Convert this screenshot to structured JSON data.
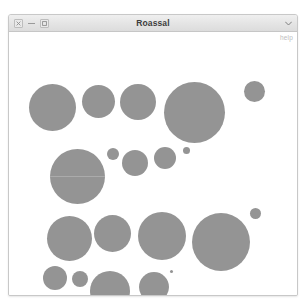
{
  "window": {
    "title": "Roassal",
    "controls": [
      {
        "name": "close",
        "glyph": "×"
      },
      {
        "name": "minimize",
        "glyph": "–"
      },
      {
        "name": "maximize",
        "glyph": "□"
      }
    ],
    "menu_glyph": "▾",
    "help_label": "help"
  },
  "colors": {
    "bubble_fill": "#949494",
    "canvas_background": "#ffffff",
    "titlebar_background": "#e4e4e4",
    "window_border": "#c8c8c8",
    "help_text": "#bcbcbc"
  },
  "chart_data": {
    "type": "scatter",
    "title": "Roassal",
    "xlabel": "",
    "ylabel": "",
    "grid": false,
    "legend": null,
    "encoding": "circle area encodes value; circles packed left-to-right in rows",
    "xlim": [
      0,
      272
    ],
    "ylim": [
      0,
      262
    ],
    "bubbles": [
      {
        "row": 1,
        "cx": 43,
        "cy": 74,
        "r": 23.5
      },
      {
        "row": 1,
        "cx": 89,
        "cy": 68,
        "r": 16.5
      },
      {
        "row": 1,
        "cx": 129,
        "cy": 69,
        "r": 18.0
      },
      {
        "row": 1,
        "cx": 185,
        "cy": 79,
        "r": 30.5
      },
      {
        "row": 1,
        "cx": 245,
        "cy": 58,
        "r": 10.5
      },
      {
        "row": 2,
        "cx": 68,
        "cy": 143,
        "r": 27.5
      },
      {
        "row": 2,
        "cx": 104,
        "cy": 121,
        "r": 6.0
      },
      {
        "row": 2,
        "cx": 126,
        "cy": 130,
        "r": 13.0
      },
      {
        "row": 2,
        "cx": 156,
        "cy": 125,
        "r": 11.0
      },
      {
        "row": 2,
        "cx": 177,
        "cy": 117,
        "r": 3.5
      },
      {
        "row": 3,
        "cx": 60,
        "cy": 205,
        "r": 22.5
      },
      {
        "row": 3,
        "cx": 103,
        "cy": 200,
        "r": 18.5
      },
      {
        "row": 3,
        "cx": 153,
        "cy": 203,
        "r": 24.0
      },
      {
        "row": 3,
        "cx": 212,
        "cy": 209,
        "r": 29.0
      },
      {
        "row": 3,
        "cx": 246,
        "cy": 180,
        "r": 5.5
      },
      {
        "row": 4,
        "cx": 46,
        "cy": 245,
        "r": 12.0
      },
      {
        "row": 4,
        "cx": 71,
        "cy": 246,
        "r": 8.0
      },
      {
        "row": 4,
        "cx": 101,
        "cy": 258,
        "r": 20.0
      },
      {
        "row": 4,
        "cx": 145,
        "cy": 254,
        "r": 15.0
      },
      {
        "row": 4,
        "cx": 162,
        "cy": 238,
        "r": 1.5
      }
    ]
  }
}
